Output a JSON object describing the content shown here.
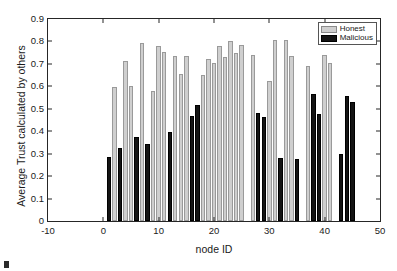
{
  "chart_data": {
    "type": "bar",
    "title": "",
    "xlabel": "node ID",
    "ylabel": "Average Trust calculated by others",
    "xlim": [
      -10,
      50
    ],
    "ylim": [
      0,
      0.9
    ],
    "xticks": [
      -10,
      0,
      10,
      20,
      30,
      40,
      50
    ],
    "xtick_labels": [
      "-10",
      "0",
      "10",
      "20",
      "30",
      "40",
      "50"
    ],
    "yticks": [
      0,
      0.1,
      0.2,
      0.3,
      0.4,
      0.5,
      0.6,
      0.7,
      0.8,
      0.9
    ],
    "ytick_labels": [
      "0",
      "0.1",
      "0.2",
      "0.3",
      "0.4",
      "0.5",
      "0.6",
      "0.7",
      "0.8",
      "0.9"
    ],
    "grid": false,
    "legend": {
      "position": "top-right",
      "entries": [
        {
          "name": "Honest",
          "color": "#cfcfcf"
        },
        {
          "name": "Malicious",
          "color": "#141414"
        }
      ]
    },
    "series": [
      {
        "name": "Honest",
        "color": "#cfcfcf",
        "points": [
          {
            "x": 2,
            "y": 0.595
          },
          {
            "x": 4,
            "y": 0.713
          },
          {
            "x": 5,
            "y": 0.603
          },
          {
            "x": 7,
            "y": 0.793
          },
          {
            "x": 9,
            "y": 0.58
          },
          {
            "x": 10,
            "y": 0.781
          },
          {
            "x": 11,
            "y": 0.755
          },
          {
            "x": 13,
            "y": 0.735
          },
          {
            "x": 14,
            "y": 0.655
          },
          {
            "x": 15,
            "y": 0.737
          },
          {
            "x": 18,
            "y": 0.65
          },
          {
            "x": 19,
            "y": 0.72
          },
          {
            "x": 20,
            "y": 0.705
          },
          {
            "x": 21,
            "y": 0.778
          },
          {
            "x": 22,
            "y": 0.732
          },
          {
            "x": 23,
            "y": 0.8
          },
          {
            "x": 24,
            "y": 0.75
          },
          {
            "x": 25,
            "y": 0.786
          },
          {
            "x": 27,
            "y": 0.74
          },
          {
            "x": 30,
            "y": 0.623
          },
          {
            "x": 31,
            "y": 0.808
          },
          {
            "x": 33,
            "y": 0.805
          },
          {
            "x": 34,
            "y": 0.737
          },
          {
            "x": 37,
            "y": 0.69
          },
          {
            "x": 40,
            "y": 0.738
          },
          {
            "x": 41,
            "y": 0.703
          }
        ]
      },
      {
        "name": "Malicious",
        "color": "#141414",
        "points": [
          {
            "x": 1,
            "y": 0.283
          },
          {
            "x": 3,
            "y": 0.324
          },
          {
            "x": 6,
            "y": 0.376
          },
          {
            "x": 8,
            "y": 0.341
          },
          {
            "x": 12,
            "y": 0.395
          },
          {
            "x": 16,
            "y": 0.468
          },
          {
            "x": 17,
            "y": 0.518
          },
          {
            "x": 28,
            "y": 0.483
          },
          {
            "x": 29,
            "y": 0.463
          },
          {
            "x": 32,
            "y": 0.28
          },
          {
            "x": 35,
            "y": 0.276
          },
          {
            "x": 38,
            "y": 0.568
          },
          {
            "x": 39,
            "y": 0.478
          },
          {
            "x": 43,
            "y": 0.298
          },
          {
            "x": 44,
            "y": 0.557
          },
          {
            "x": 45,
            "y": 0.531
          }
        ]
      }
    ]
  }
}
